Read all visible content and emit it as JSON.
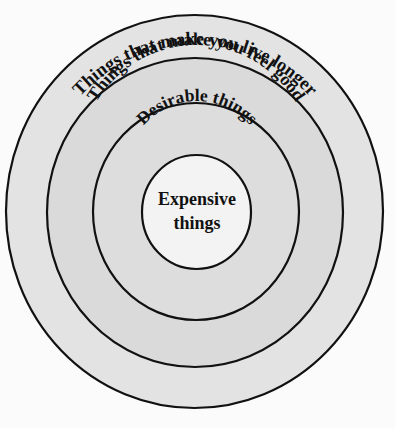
{
  "diagram": {
    "type": "concentric-circles",
    "colors": {
      "background": "#fbfbfb",
      "stroke": "#111111",
      "outer_ring": "#e3e3e3",
      "second_ring": "#dadada",
      "third_ring": "#dddddd",
      "inner_circle": "#f3f3f3",
      "text": "#111111"
    },
    "rings": [
      {
        "id": "outer",
        "label": "Things that make you live longer"
      },
      {
        "id": "second",
        "label": "Things that make you feel good"
      },
      {
        "id": "third",
        "label": "Desirable things"
      },
      {
        "id": "inner",
        "label_line1": "Expensive",
        "label_line2": "things"
      }
    ]
  }
}
